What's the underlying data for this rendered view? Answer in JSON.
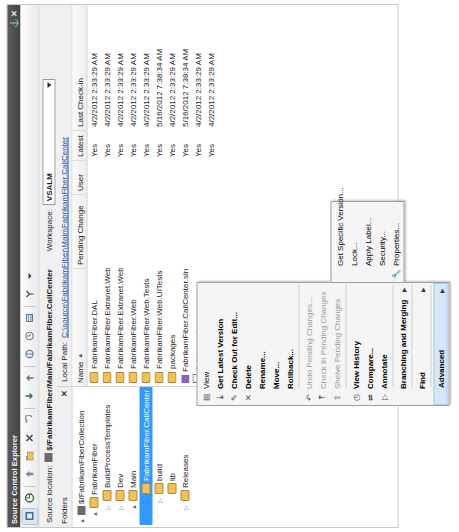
{
  "window": {
    "title": "Source Control Explorer",
    "pin_label": "⚓",
    "close_label": "✕"
  },
  "toolbar": {
    "items": [
      {
        "name": "refresh-icon",
        "glyph": "⟳"
      },
      {
        "name": "home-icon",
        "glyph": "⌂"
      },
      {
        "name": "up-folder-icon",
        "glyph": "↑"
      },
      {
        "name": "new-folder-icon",
        "glyph": "🗀"
      },
      {
        "name": "delete-icon",
        "glyph": "✕"
      },
      {
        "name": "undo-icon",
        "glyph": "↶"
      },
      {
        "name": "get-latest-icon",
        "glyph": "⤓"
      },
      {
        "name": "check-in-icon",
        "glyph": "⤒"
      },
      {
        "name": "compare-icon",
        "glyph": "⇄"
      },
      {
        "name": "history-icon",
        "glyph": "◷"
      },
      {
        "name": "properties-icon",
        "glyph": "▤"
      },
      {
        "name": "branch-icon",
        "glyph": "⑂"
      }
    ]
  },
  "location": {
    "source_location_label": "Source location:",
    "source_location_value": "$/FabrikamFiber/Main/FabrikamFiber.CallCenter",
    "workspace_label": "Workspace:",
    "workspace_value": "VSALM"
  },
  "folders_pane": {
    "header": "Folders",
    "close_label": "✕",
    "nodes": [
      {
        "label": "$/FabrikamFiberCollection",
        "indent": 0,
        "expander": "▲",
        "icon": "root-icon",
        "selected": false
      },
      {
        "label": "FabrikamFiber",
        "indent": 1,
        "expander": "▲",
        "icon": "folder-icon",
        "selected": false
      },
      {
        "label": "BuildProcessTemplates",
        "indent": 2,
        "expander": "▷",
        "icon": "folder-icon",
        "selected": false
      },
      {
        "label": "Dev",
        "indent": 2,
        "expander": "▷",
        "icon": "folder-icon",
        "selected": false
      },
      {
        "label": "Main",
        "indent": 2,
        "expander": "▲",
        "icon": "folder-icon",
        "selected": false
      },
      {
        "label": "FabrikamFiber.CallCenter",
        "indent": 3,
        "expander": "▷",
        "icon": "folder-icon",
        "selected": true
      },
      {
        "label": "build",
        "indent": 3,
        "expander": "▷",
        "icon": "folder-icon",
        "selected": false
      },
      {
        "label": "lib",
        "indent": 3,
        "expander": "",
        "icon": "folder-icon",
        "selected": false
      },
      {
        "label": "Releases",
        "indent": 2,
        "expander": "▷",
        "icon": "folder-icon",
        "selected": false
      }
    ]
  },
  "files_pane": {
    "local_path_label": "Local Path:",
    "local_path_value": "C:\\source\\FabrikamFiber\\Main\\FabrikamFiber.CallCenter",
    "columns": [
      {
        "key": "name",
        "label": "Name",
        "sort": "▲"
      },
      {
        "key": "pending",
        "label": "Pending Change",
        "sort": ""
      },
      {
        "key": "user",
        "label": "User",
        "sort": ""
      },
      {
        "key": "latest",
        "label": "Latest",
        "sort": ""
      },
      {
        "key": "checkin",
        "label": "Last Check-in",
        "sort": ""
      }
    ],
    "rows": [
      {
        "icon": "folder-icon",
        "name": "FabrikamFiber.DAL",
        "pending": "",
        "user": "",
        "latest": "Yes",
        "checkin": "4/2/2012 2:33:29 AM"
      },
      {
        "icon": "folder-icon",
        "name": "FabrikamFiber.Extranet.Web",
        "pending": "",
        "user": "",
        "latest": "Yes",
        "checkin": "4/2/2012 2:33:29 AM"
      },
      {
        "icon": "folder-icon",
        "name": "FabrikamFiber.Extranet.Web.Tests",
        "pending": "",
        "user": "",
        "latest": "Yes",
        "checkin": "4/2/2012 2:33:29 AM"
      },
      {
        "icon": "folder-icon",
        "name": "FabrikamFiber.Web",
        "pending": "",
        "user": "",
        "latest": "Yes",
        "checkin": "4/2/2012 2:33:29 AM"
      },
      {
        "icon": "folder-icon",
        "name": "FabrikamFiber.Web.Tests",
        "pending": "",
        "user": "",
        "latest": "Yes",
        "checkin": "4/2/2012 2:33:29 AM"
      },
      {
        "icon": "folder-icon",
        "name": "FabrikamFiber.Web.UITests",
        "pending": "",
        "user": "",
        "latest": "Yes",
        "checkin": "5/16/2012 7:38:34 AM"
      },
      {
        "icon": "folder-icon",
        "name": "packages",
        "pending": "",
        "user": "",
        "latest": "Yes",
        "checkin": "4/2/2012 2:33:29 AM"
      },
      {
        "icon": "solution-icon",
        "name": "FabrikamFiber.CallCenter.sln",
        "pending": "",
        "user": "",
        "latest": "Yes",
        "checkin": "5/16/2012 7:38:34 AM"
      },
      {
        "icon": "doc-icon",
        "name": "Setting.xml",
        "pending": "",
        "user": "",
        "latest": "Yes",
        "checkin": "4/2/2012 2:33:29 AM"
      },
      {
        "icon": "doc-icon",
        "name": "",
        "pending": "",
        "user": "",
        "latest": "Yes",
        "checkin": "4/2/2012 2:33:29 AM"
      }
    ]
  },
  "context_menu": {
    "items": [
      {
        "label": "View",
        "icon": "view-icon",
        "glyph": "▤",
        "bold": false,
        "disabled": false,
        "submenu": false,
        "separator_after": false
      },
      {
        "label": "Get Latest Version",
        "icon": "get-latest-icon",
        "glyph": "⤓",
        "bold": true,
        "disabled": false,
        "submenu": false,
        "separator_after": false
      },
      {
        "label": "Check Out for Edit...",
        "icon": "checkout-icon",
        "glyph": "✎",
        "bold": true,
        "disabled": false,
        "submenu": false,
        "separator_after": false
      },
      {
        "label": "Delete",
        "icon": "delete-icon",
        "glyph": "✕",
        "bold": true,
        "disabled": false,
        "submenu": false,
        "separator_after": false
      },
      {
        "label": "Rename...",
        "icon": "rename-icon",
        "glyph": "",
        "bold": true,
        "disabled": false,
        "submenu": false,
        "separator_after": false
      },
      {
        "label": "Move...",
        "icon": "move-icon",
        "glyph": "",
        "bold": true,
        "disabled": false,
        "submenu": false,
        "separator_after": false
      },
      {
        "label": "Rollback...",
        "icon": "rollback-icon",
        "glyph": "",
        "bold": true,
        "disabled": false,
        "submenu": false,
        "separator_after": true
      },
      {
        "label": "Undo Pending Changes...",
        "icon": "undo-icon",
        "glyph": "↶",
        "bold": false,
        "disabled": true,
        "submenu": false,
        "separator_after": false
      },
      {
        "label": "Check In Pending Changes",
        "icon": "checkin-icon",
        "glyph": "⤒",
        "bold": false,
        "disabled": true,
        "submenu": false,
        "separator_after": false
      },
      {
        "label": "Shelve Pending Changes",
        "icon": "shelve-icon",
        "glyph": "⇪",
        "bold": false,
        "disabled": true,
        "submenu": false,
        "separator_after": true
      },
      {
        "label": "View History",
        "icon": "history-icon",
        "glyph": "◷",
        "bold": true,
        "disabled": false,
        "submenu": false,
        "separator_after": false
      },
      {
        "label": "Compare...",
        "icon": "compare-icon",
        "glyph": "⇄",
        "bold": true,
        "disabled": false,
        "submenu": false,
        "separator_after": false
      },
      {
        "label": "Annotate",
        "icon": "annotate-icon",
        "glyph": "▷",
        "bold": true,
        "disabled": false,
        "submenu": false,
        "separator_after": true
      },
      {
        "label": "Branching and Merging",
        "icon": "branch-icon",
        "glyph": "",
        "bold": true,
        "disabled": false,
        "submenu": true,
        "separator_after": true
      },
      {
        "label": "Find",
        "icon": "find-icon",
        "glyph": "",
        "bold": true,
        "disabled": false,
        "submenu": true,
        "separator_after": true
      },
      {
        "label": "Advanced",
        "icon": "advanced-icon",
        "glyph": "",
        "bold": true,
        "disabled": false,
        "submenu": true,
        "separator_after": false,
        "highlighted": true
      }
    ]
  },
  "submenu": {
    "items": [
      {
        "label": "Get Specific Version...",
        "icon": "get-specific-icon",
        "glyph": "",
        "bold": false
      },
      {
        "label": "Lock...",
        "icon": "lock-icon",
        "glyph": "",
        "bold": false
      },
      {
        "label": "Apply Label...",
        "icon": "label-icon",
        "glyph": "",
        "bold": false
      },
      {
        "label": "Security...",
        "icon": "security-icon",
        "glyph": "",
        "bold": false
      },
      {
        "label": "Properties...",
        "icon": "properties-icon",
        "glyph": "🔧",
        "bold": false
      }
    ]
  }
}
